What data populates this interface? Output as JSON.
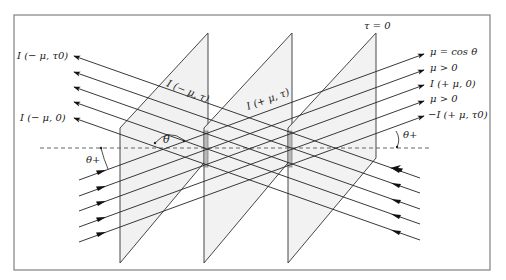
{
  "figure": {
    "type": "radiative-transfer-slab-diagram",
    "frame": {
      "x": 14,
      "y": 15,
      "width": 476,
      "height": 255
    },
    "colors": {
      "frame": "#888888",
      "lines": "#222222",
      "plane_fill": "#f2f2f2",
      "plane_edge": "#333333",
      "strip": "#b9b9b9",
      "dashed": "#555555"
    }
  },
  "labels": {
    "left_top": "I (− μ, τ0)",
    "left_bottom": "I (− μ, 0)",
    "plane1_label": "I (− μ, τ)",
    "plane2_label": "I (+ μ, τ)",
    "tau_zero": "τ = 0",
    "right_1": "μ = cos θ",
    "right_2": "μ > 0",
    "right_3": "I (+ μ, 0)",
    "right_4": "μ > 0",
    "right_5": "−I (+ μ, τ0)",
    "theta": "θ",
    "theta_plus_left": "θ+",
    "theta_plus_right": "θ+"
  },
  "planes": [
    {
      "left_x": 120,
      "right_x": 208
    },
    {
      "left_x": 204,
      "right_x": 292
    },
    {
      "left_x": 288,
      "right_x": 376
    }
  ],
  "rays_outgoing_left": {
    "count": 5,
    "direction": "up-left",
    "arrow_end_x": 74,
    "arrow_end_y": [
      56,
      72,
      87,
      102,
      118
    ],
    "start_x": 420,
    "start_y": [
      178,
      193,
      209,
      224,
      240
    ]
  },
  "rays_outgoing_right": {
    "count": 5,
    "direction": "up-right",
    "arrow_end_x": 424,
    "arrow_end_y": [
      54,
      70,
      85,
      101,
      116
    ],
    "start_x": 79,
    "start_y": [
      180,
      196,
      211,
      227,
      242
    ]
  },
  "horizon_dashed_y": 148
}
